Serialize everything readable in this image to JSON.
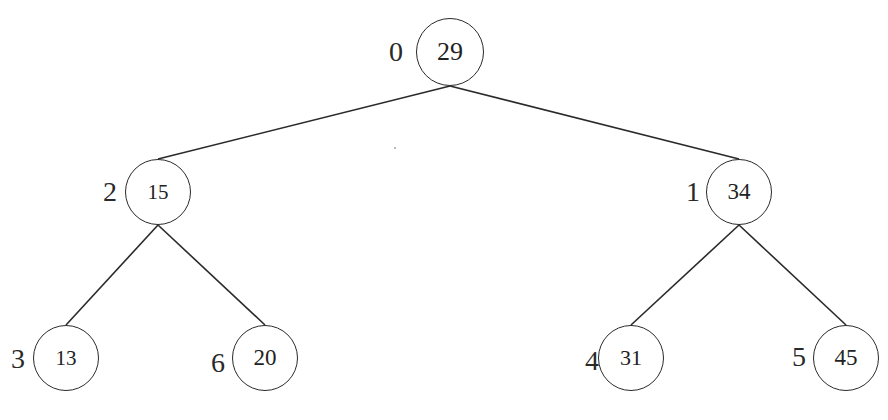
{
  "diagram": {
    "type": "binary-tree",
    "stroke_color": "#2a2a2a",
    "background": "#ffffff",
    "nodes": [
      {
        "id": "n0",
        "index": "0",
        "value": "29",
        "cx": 450,
        "cy": 52,
        "r": 34,
        "font": 26
      },
      {
        "id": "n2",
        "index": "2",
        "value": "15",
        "cx": 158,
        "cy": 192,
        "r": 33,
        "font": 21
      },
      {
        "id": "n1",
        "index": "1",
        "value": "34",
        "cx": 739,
        "cy": 192,
        "r": 33,
        "font": 23
      },
      {
        "id": "n3",
        "index": "3",
        "value": "13",
        "cx": 66,
        "cy": 358,
        "r": 33,
        "font": 21
      },
      {
        "id": "n6",
        "index": "6",
        "value": "20",
        "cx": 265,
        "cy": 358,
        "r": 33,
        "font": 23
      },
      {
        "id": "n4",
        "index": "4",
        "value": "31",
        "cx": 631,
        "cy": 358,
        "r": 33,
        "font": 22
      },
      {
        "id": "n5",
        "index": "5",
        "value": "45",
        "cx": 846,
        "cy": 358,
        "r": 33,
        "font": 23
      }
    ],
    "edges": [
      {
        "from": "n0",
        "to": "n2"
      },
      {
        "from": "n0",
        "to": "n1"
      },
      {
        "from": "n2",
        "to": "n3"
      },
      {
        "from": "n2",
        "to": "n6"
      },
      {
        "from": "n1",
        "to": "n4"
      },
      {
        "from": "n1",
        "to": "n5"
      }
    ]
  }
}
